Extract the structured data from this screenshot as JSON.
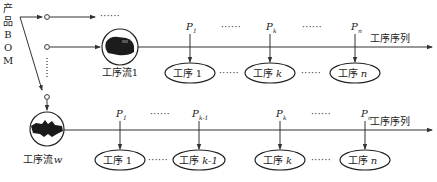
{
  "source_label": {
    "chars": [
      "产",
      "品",
      "B",
      "O",
      "M"
    ]
  },
  "ellipsis": "······",
  "stream_top": {
    "label": "工序流1",
    "sequence_label": "工序序列",
    "params": [
      {
        "main": "P",
        "sub": "1"
      },
      {
        "main": "P",
        "sub": "k"
      },
      {
        "main": "P",
        "sub": "n"
      }
    ],
    "processes": [
      {
        "prefix": "工序",
        "idx": "1"
      },
      {
        "prefix": "工序",
        "idx": "k"
      },
      {
        "prefix": "工序",
        "idx": "n"
      }
    ]
  },
  "stream_bottom": {
    "label_prefix": "工序流",
    "label_idx": "w",
    "sequence_label": "工序序列",
    "params": [
      {
        "main": "P",
        "sub": "1"
      },
      {
        "main": "P",
        "sub": "k-1"
      },
      {
        "main": "P",
        "sub": "k"
      },
      {
        "main": "P",
        "sub": "n"
      }
    ],
    "processes": [
      {
        "prefix": "工序",
        "idx": "1"
      },
      {
        "prefix": "工序",
        "idx": "k-1"
      },
      {
        "prefix": "工序",
        "idx": "k"
      },
      {
        "prefix": "工序",
        "idx": "n"
      }
    ]
  }
}
